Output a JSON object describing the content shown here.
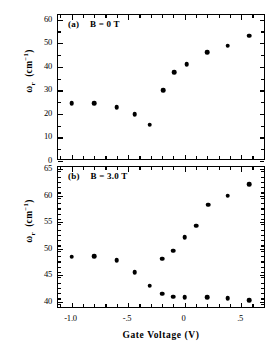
{
  "figure": {
    "xlabel": "Gate Voltage   (V)",
    "x_ticklabels": [
      "-1.0",
      "-.5",
      "0",
      ".5"
    ],
    "x_tickvalues": [
      -1.0,
      -0.5,
      0.0,
      0.5
    ],
    "xlim": [
      -1.12,
      0.72
    ],
    "x_minor_step": 0.1
  },
  "chart_data": [
    {
      "type": "scatter",
      "panel": "a",
      "tag": "(a)",
      "annotation": "B = 0 T",
      "title": "",
      "xlabel": "Gate Voltage   (V)",
      "ylabel": "ωr (cm-1)",
      "ylabel_parts": {
        "omega": "ω",
        "sub": "r",
        "unit_open": " (cm",
        "unit_exp": "−1",
        "unit_close": ")"
      },
      "xlim": [
        -1.12,
        0.72
      ],
      "ylim": [
        0,
        62
      ],
      "y_ticklabels": [
        "0",
        "10",
        "20",
        "30",
        "40",
        "50",
        "60"
      ],
      "y_tickvalues": [
        0,
        10,
        20,
        30,
        40,
        50,
        60
      ],
      "y_minor_step": 5,
      "grid": false,
      "legend": "none",
      "marker": "filled-circle",
      "x": [
        -1.0,
        -0.8,
        -0.6,
        -0.45,
        -0.32,
        -0.2,
        -0.1,
        0.0,
        0.1,
        0.21,
        0.32,
        0.45,
        0.58
      ],
      "y": [
        24.6,
        24.5,
        22.8,
        19.8,
        15.5,
        30.1,
        37.6,
        41.1,
        41.1,
        46.3,
        46.3,
        49.0,
        53.2
      ],
      "points": [
        {
          "x": -1.0,
          "y": 24.6
        },
        {
          "x": -0.8,
          "y": 24.5
        },
        {
          "x": -0.6,
          "y": 22.8
        },
        {
          "x": -0.44,
          "y": 19.8
        },
        {
          "x": -0.31,
          "y": 15.5
        },
        {
          "x": -0.19,
          "y": 30.1
        },
        {
          "x": -0.09,
          "y": 37.6
        },
        {
          "x": 0.02,
          "y": 41.1
        },
        {
          "x": 0.2,
          "y": 46.3
        },
        {
          "x": 0.38,
          "y": 49.0
        },
        {
          "x": 0.57,
          "y": 53.2
        }
      ]
    },
    {
      "type": "scatter",
      "panel": "b",
      "tag": "(b)",
      "annotation": "B = 3.0 T",
      "title": "",
      "xlabel": "Gate Voltage   (V)",
      "ylabel": "ωr (cm-1)",
      "ylabel_parts": {
        "omega": "ω",
        "sub": "r",
        "unit_open": " (cm",
        "unit_exp": "−1",
        "unit_close": ")"
      },
      "xlim": [
        -1.12,
        0.72
      ],
      "ylim": [
        38.6,
        65.4
      ],
      "y_ticklabels": [
        "40",
        "45",
        "50",
        "55",
        "60",
        "65"
      ],
      "y_tickvalues": [
        40,
        45,
        50,
        55,
        60,
        65
      ],
      "y_minor_step": 1,
      "grid": false,
      "legend": "none",
      "marker": "filled-circle",
      "series": [
        {
          "name": "upper-branch",
          "points": [
            {
              "x": -1.0,
              "y": 48.5
            },
            {
              "x": -0.8,
              "y": 48.6
            },
            {
              "x": -0.6,
              "y": 47.8
            },
            {
              "x": -0.44,
              "y": 45.6
            },
            {
              "x": -0.31,
              "y": 43.0
            },
            {
              "x": -0.2,
              "y": 48.1
            },
            {
              "x": -0.1,
              "y": 49.6
            },
            {
              "x": 0.0,
              "y": 52.1
            },
            {
              "x": 0.1,
              "y": 54.3
            },
            {
              "x": 0.21,
              "y": 58.3
            },
            {
              "x": 0.38,
              "y": 60.0
            },
            {
              "x": 0.57,
              "y": 62.1
            }
          ]
        },
        {
          "name": "lower-branch",
          "points": [
            {
              "x": -0.2,
              "y": 41.5
            },
            {
              "x": -0.1,
              "y": 40.9
            },
            {
              "x": 0.0,
              "y": 40.8
            },
            {
              "x": 0.2,
              "y": 40.8
            },
            {
              "x": 0.38,
              "y": 40.6
            },
            {
              "x": 0.57,
              "y": 40.3
            }
          ]
        }
      ]
    }
  ]
}
